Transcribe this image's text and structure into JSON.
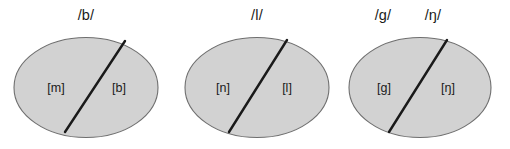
{
  "figure": {
    "type": "phoneme-allophone-diagram",
    "background_color": "#ffffff",
    "ellipse_fill_color": "#d2d2d2",
    "ellipse_stroke_color": "#6e6e6e",
    "divider_color": "#1a1a1a",
    "text_color": "#1a1a1a"
  },
  "groups": [
    {
      "id": "group-b",
      "phoneme_labels": [
        "/b/"
      ],
      "allophone_left": "[m]",
      "allophone_right": "[b]"
    },
    {
      "id": "group-l",
      "phoneme_labels": [
        "/l/"
      ],
      "allophone_left": "[n]",
      "allophone_right": "[l]"
    },
    {
      "id": "group-g",
      "phoneme_labels": [
        "/g/",
        "/ŋ/"
      ],
      "allophone_left": "[g]",
      "allophone_right": "[ŋ]"
    }
  ]
}
